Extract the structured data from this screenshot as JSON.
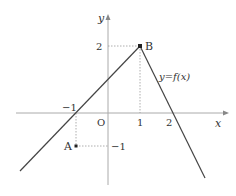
{
  "diagram": {
    "axes": {
      "x_label": "x",
      "y_label": "y",
      "origin_label": "O"
    },
    "ticks": {
      "x_neg1": "−1",
      "x_1": "1",
      "x_2": "2",
      "y_2": "2",
      "y_neg1": "−1"
    },
    "points": {
      "A": {
        "label": "A",
        "x": -1,
        "y": -1
      },
      "B": {
        "label": "B",
        "x": 1,
        "y": 2
      }
    },
    "function_label": "y=f(x)",
    "colors": {
      "curve": "#444444",
      "axis": "#aaaaaa",
      "guide": "#999999",
      "text": "#333333"
    }
  }
}
